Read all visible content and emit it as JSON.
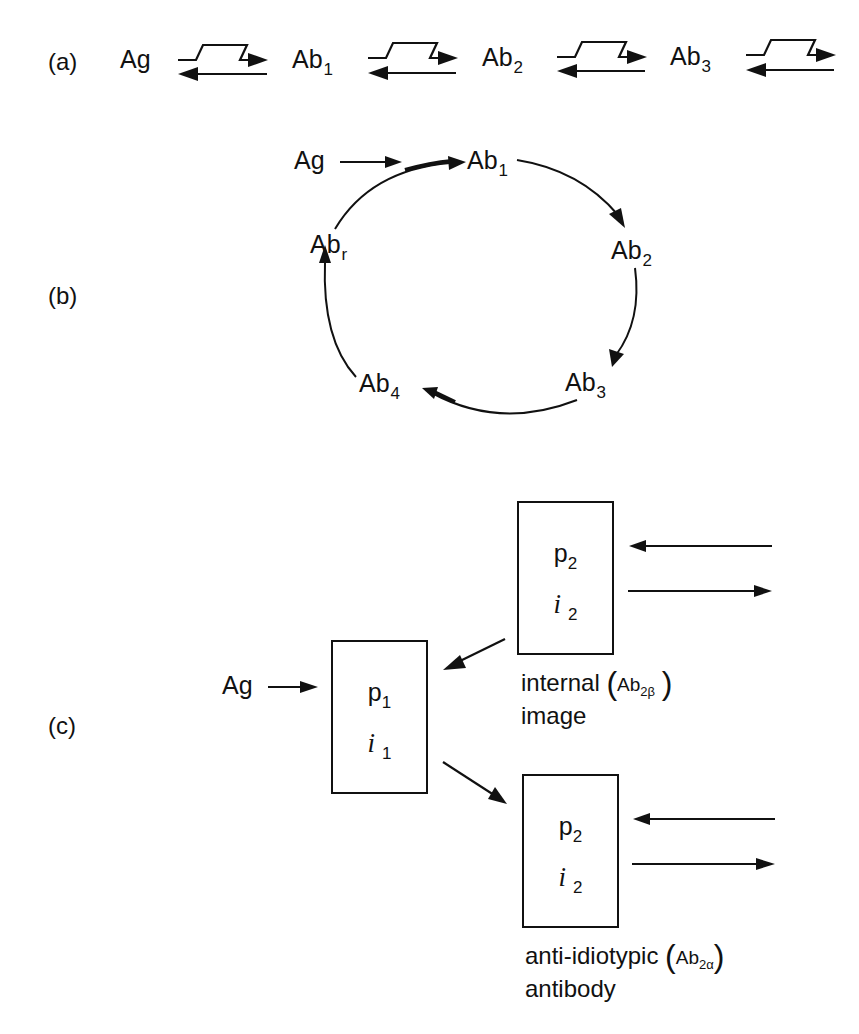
{
  "panels": {
    "a": {
      "label": "(a)",
      "nodes": [
        "Ag",
        "Ab",
        "Ab",
        "Ab"
      ],
      "node_subscripts": [
        "",
        "1",
        "2",
        "3"
      ],
      "connector": "zigzag forward arrow over reverse arrow (equilibrium)"
    },
    "b": {
      "label": "(b)",
      "input": "Ag",
      "cycle": [
        {
          "text": "Ab",
          "sub": "1"
        },
        {
          "text": "Ab",
          "sub": "2"
        },
        {
          "text": "Ab",
          "sub": "3"
        },
        {
          "text": "Ab",
          "sub": "4"
        },
        {
          "text": "Ab",
          "sub": "r"
        }
      ]
    },
    "c": {
      "label": "(c)",
      "input": "Ag",
      "box1": {
        "p": "p",
        "p_sub": "1",
        "i": "i",
        "i_sub": "1"
      },
      "box_top": {
        "p": "p",
        "p_sub": "2",
        "i": "i",
        "i_sub": "2",
        "caption_line1": "internal",
        "caption_line2": "image",
        "tag": "Ab",
        "tag_sub": "2β"
      },
      "box_bottom": {
        "p": "p",
        "p_sub": "2",
        "i": "i",
        "i_sub": "2",
        "caption_line1": "anti-idiotypic",
        "caption_line2": "antibody",
        "tag": "Ab",
        "tag_sub": "2α"
      }
    }
  }
}
